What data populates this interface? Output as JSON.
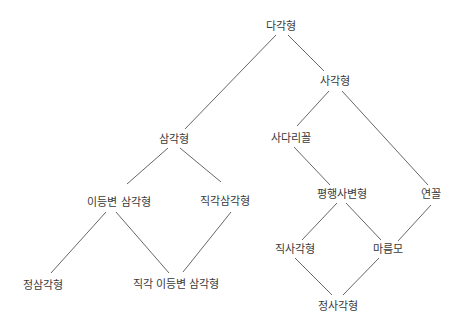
{
  "diagram": {
    "type": "hierarchy",
    "line_color": "#555555",
    "text_color": "#3a3a3a",
    "nodes": [
      {
        "id": "polygon",
        "label": "다각형",
        "x": 281,
        "y": 26
      },
      {
        "id": "quadrilateral",
        "label": "사각형",
        "x": 335,
        "y": 81
      },
      {
        "id": "triangle",
        "label": "삼각형",
        "x": 174,
        "y": 139
      },
      {
        "id": "trapezoid",
        "label": "사다리꼴",
        "x": 291,
        "y": 138
      },
      {
        "id": "isosceles",
        "label": "이등변 삼각형",
        "x": 119,
        "y": 202
      },
      {
        "id": "right-triangle",
        "label": "직각삼각형",
        "x": 225,
        "y": 201
      },
      {
        "id": "parallelogram",
        "label": "평행사변형",
        "x": 342,
        "y": 194
      },
      {
        "id": "kite",
        "label": "연꼴",
        "x": 431,
        "y": 194
      },
      {
        "id": "rectangle",
        "label": "직사각형",
        "x": 295,
        "y": 249
      },
      {
        "id": "rhombus",
        "label": "마름모",
        "x": 388,
        "y": 249
      },
      {
        "id": "equilateral",
        "label": "정삼각형",
        "x": 43,
        "y": 285
      },
      {
        "id": "right-isosceles",
        "label": "직각 이등변 삼각형",
        "x": 176,
        "y": 284
      },
      {
        "id": "square",
        "label": "정사각형",
        "x": 338,
        "y": 306
      }
    ],
    "edges": [
      {
        "from": "polygon",
        "to": "triangle",
        "x1": 276,
        "y1": 35,
        "x2": 185,
        "y2": 129
      },
      {
        "from": "polygon",
        "to": "quadrilateral",
        "x1": 288,
        "y1": 35,
        "x2": 324,
        "y2": 71
      },
      {
        "from": "quadrilateral",
        "to": "trapezoid",
        "x1": 329,
        "y1": 91,
        "x2": 297,
        "y2": 126
      },
      {
        "from": "quadrilateral",
        "to": "kite",
        "x1": 342,
        "y1": 91,
        "x2": 428,
        "y2": 185
      },
      {
        "from": "triangle",
        "to": "isosceles",
        "x1": 168,
        "y1": 148,
        "x2": 127,
        "y2": 184
      },
      {
        "from": "triangle",
        "to": "right-triangle",
        "x1": 180,
        "y1": 148,
        "x2": 221,
        "y2": 182
      },
      {
        "from": "trapezoid",
        "to": "parallelogram",
        "x1": 294,
        "y1": 147,
        "x2": 330,
        "y2": 185
      },
      {
        "from": "kite",
        "to": "rhombus",
        "x1": 431,
        "y1": 205,
        "x2": 398,
        "y2": 241
      },
      {
        "from": "parallelogram",
        "to": "rectangle",
        "x1": 337,
        "y1": 203,
        "x2": 302,
        "y2": 240
      },
      {
        "from": "parallelogram",
        "to": "rhombus",
        "x1": 346,
        "y1": 203,
        "x2": 381,
        "y2": 240
      },
      {
        "from": "isosceles",
        "to": "equilateral",
        "x1": 106,
        "y1": 212,
        "x2": 51,
        "y2": 273
      },
      {
        "from": "isosceles",
        "to": "right-isosceles",
        "x1": 116,
        "y1": 212,
        "x2": 169,
        "y2": 273
      },
      {
        "from": "right-triangle",
        "to": "right-isosceles",
        "x1": 231,
        "y1": 212,
        "x2": 183,
        "y2": 272
      },
      {
        "from": "rectangle",
        "to": "square",
        "x1": 295,
        "y1": 258,
        "x2": 332,
        "y2": 295
      },
      {
        "from": "rhombus",
        "to": "square",
        "x1": 379,
        "y1": 258,
        "x2": 343,
        "y2": 295
      }
    ]
  }
}
